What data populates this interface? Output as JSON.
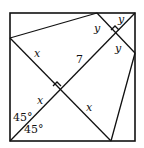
{
  "diagram": {
    "type": "geometry",
    "labels": {
      "x_upper_left": "x",
      "seven": "7",
      "x_lower_left": "x",
      "x_lower_right": "x",
      "y_left": "y",
      "y_top": "y",
      "y_right": "y",
      "angle_upper": "45°",
      "angle_lower": "45°"
    },
    "colors": {
      "stroke": "#111111",
      "background": "#ffffff"
    }
  }
}
